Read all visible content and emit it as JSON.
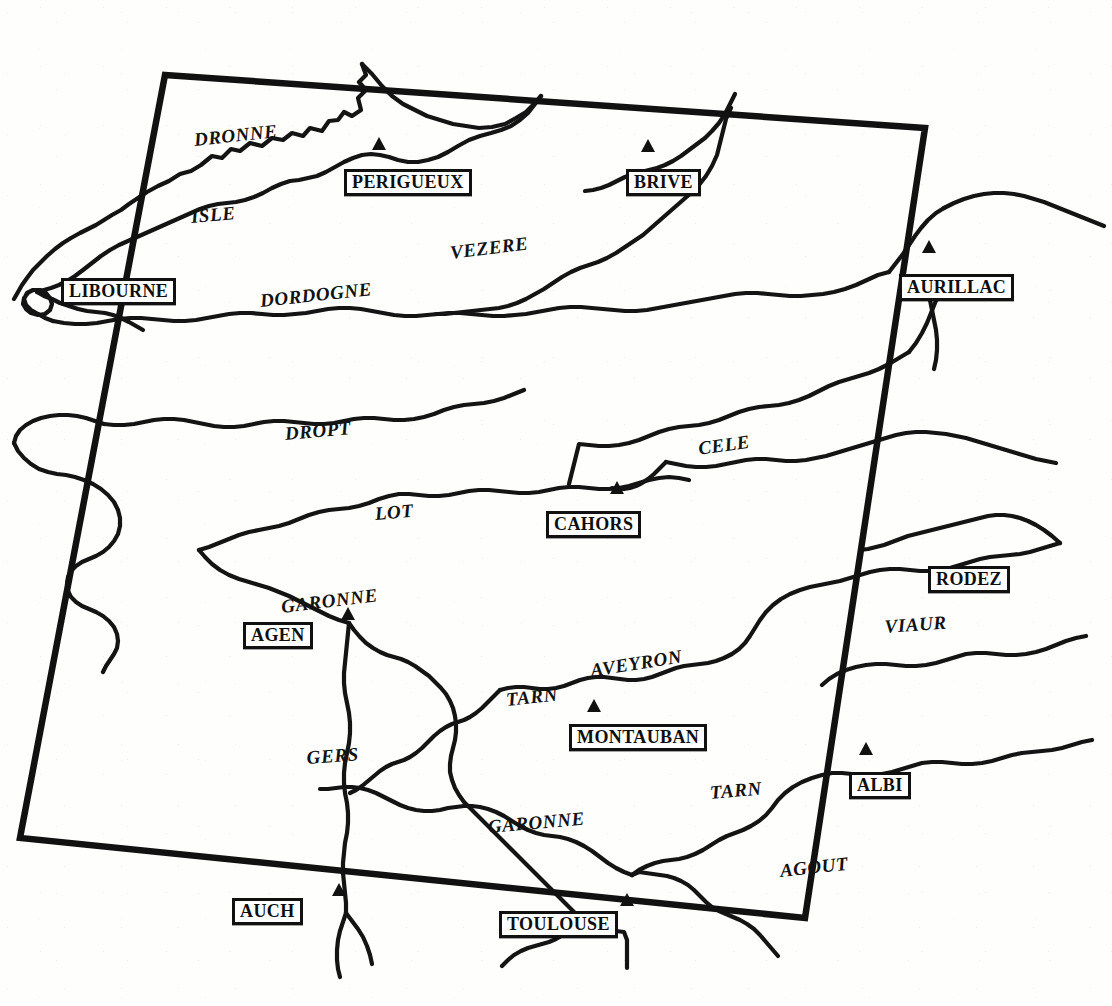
{
  "map": {
    "kind": "hand-drawn-river-basin-map",
    "region": "Aquitaine / Midi-Pyrenees river network, France",
    "background_color": "#fefefd",
    "ink_color": "#111111",
    "frame": {
      "name": "study-area-frame",
      "shape": "rotated-rectangle",
      "stroke_width": 6,
      "corners": [
        {
          "x": 165,
          "y": 75
        },
        {
          "x": 925,
          "y": 128
        },
        {
          "x": 805,
          "y": 918
        },
        {
          "x": 20,
          "y": 838
        }
      ]
    },
    "rivers": [
      {
        "name": "DRONNE",
        "label_x": 193,
        "label_y": 130,
        "rotate": -6,
        "font_size": 19
      },
      {
        "name": "ISLE",
        "label_x": 190,
        "label_y": 207,
        "rotate": -5,
        "font_size": 19
      },
      {
        "name": "DORDOGNE",
        "label_x": 259,
        "label_y": 291,
        "rotate": -6,
        "font_size": 19
      },
      {
        "name": "VEZERE",
        "label_x": 449,
        "label_y": 243,
        "rotate": -7,
        "font_size": 19
      },
      {
        "name": "DROPT",
        "label_x": 284,
        "label_y": 424,
        "rotate": -5,
        "font_size": 19
      },
      {
        "name": "LOT",
        "label_x": 374,
        "label_y": 504,
        "rotate": -5,
        "font_size": 19
      },
      {
        "name": "CELE",
        "label_x": 697,
        "label_y": 439,
        "rotate": -8,
        "font_size": 19
      },
      {
        "name": "VIAUR",
        "label_x": 884,
        "label_y": 617,
        "rotate": -4,
        "font_size": 19
      },
      {
        "name": "GARONNE",
        "label_x": 280,
        "label_y": 597,
        "rotate": -7,
        "font_size": 19
      },
      {
        "name": "AVEYRON",
        "label_x": 589,
        "label_y": 661,
        "rotate": -9,
        "font_size": 19
      },
      {
        "name": "TARN",
        "label_x": 505,
        "label_y": 690,
        "rotate": -6,
        "font_size": 19
      },
      {
        "name": "GERS",
        "label_x": 306,
        "label_y": 748,
        "rotate": -4,
        "font_size": 19
      },
      {
        "name": "TARN",
        "label_x": 709,
        "label_y": 783,
        "rotate": -5,
        "font_size": 19
      },
      {
        "name": "GARONNE",
        "label_x": 487,
        "label_y": 817,
        "rotate": -5,
        "font_size": 19
      },
      {
        "name": "AGOUT",
        "label_x": 779,
        "label_y": 861,
        "rotate": -6,
        "font_size": 19
      }
    ],
    "cities": [
      {
        "name": "LIBOURNE",
        "box_x": 61,
        "box_y": 278,
        "font_size": 18,
        "marker": false
      },
      {
        "name": "PERIGUEUX",
        "box_x": 344,
        "box_y": 169,
        "font_size": 18,
        "marker": true,
        "marker_x": 379,
        "marker_y": 150
      },
      {
        "name": "BRIVE",
        "box_x": 626,
        "box_y": 169,
        "font_size": 18,
        "marker": true,
        "marker_x": 648,
        "marker_y": 152
      },
      {
        "name": "AURILLAC",
        "box_x": 899,
        "box_y": 274,
        "font_size": 18,
        "marker": true,
        "marker_x": 929,
        "marker_y": 253
      },
      {
        "name": "CAHORS",
        "box_x": 546,
        "box_y": 511,
        "font_size": 18,
        "marker": true,
        "marker_x": 617,
        "marker_y": 494
      },
      {
        "name": "RODEZ",
        "box_x": 928,
        "box_y": 566,
        "font_size": 18,
        "marker": false
      },
      {
        "name": "AGEN",
        "box_x": 243,
        "box_y": 622,
        "font_size": 18,
        "marker": true,
        "marker_x": 348,
        "marker_y": 620
      },
      {
        "name": "MONTAUBAN",
        "box_x": 569,
        "box_y": 724,
        "font_size": 18,
        "marker": true,
        "marker_x": 594,
        "marker_y": 712
      },
      {
        "name": "ALBI",
        "box_x": 849,
        "box_y": 772,
        "font_size": 18,
        "marker": true,
        "marker_x": 866,
        "marker_y": 755
      },
      {
        "name": "AUCH",
        "box_x": 232,
        "box_y": 898,
        "font_size": 18,
        "marker": true,
        "marker_x": 339,
        "marker_y": 896
      },
      {
        "name": "TOULOUSE",
        "box_x": 499,
        "box_y": 911,
        "font_size": 18,
        "marker": true,
        "marker_x": 627,
        "marker_y": 906
      }
    ]
  }
}
